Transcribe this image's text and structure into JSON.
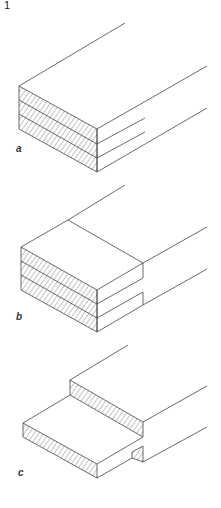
{
  "figure": {
    "number": "1",
    "panels": [
      {
        "id": "a",
        "label": "a",
        "description": "Three stacked laminated boards, flush cross-section with hatched end grain"
      },
      {
        "id": "b",
        "label": "b",
        "description": "Three stacked boards with stepped shoulder cut on top layer and notch at bottom"
      },
      {
        "id": "c",
        "label": "c",
        "description": "Half-lap joint: lower slab extending forward from upper stepped board"
      }
    ],
    "colors": {
      "line": "#444444",
      "background": "#ffffff"
    }
  }
}
